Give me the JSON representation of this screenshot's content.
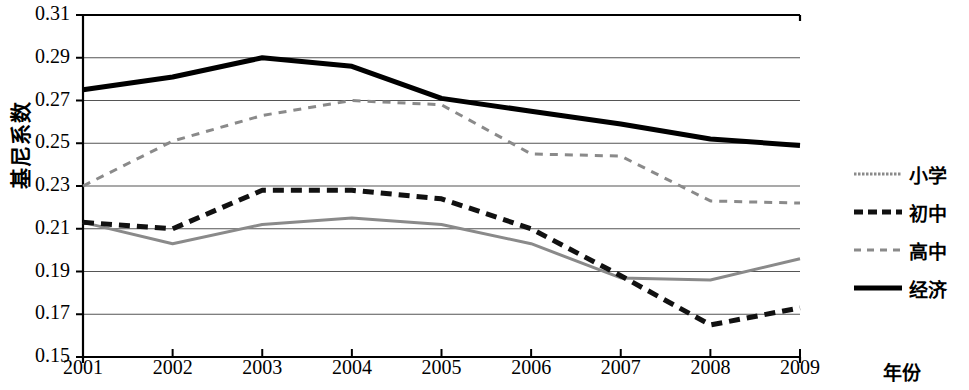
{
  "chart_data": {
    "type": "line",
    "title": "",
    "xlabel": "年份",
    "ylabel": "基尼系数",
    "x": [
      2001,
      2002,
      2003,
      2004,
      2005,
      2006,
      2007,
      2008,
      2009
    ],
    "categories": [
      "2001",
      "2002",
      "2003",
      "2004",
      "2005",
      "2006",
      "2007",
      "2008",
      "2009"
    ],
    "xlim": [
      2001,
      2009
    ],
    "ylim": [
      0.15,
      0.31
    ],
    "yticks": [
      0.15,
      0.17,
      0.19,
      0.21,
      0.23,
      0.25,
      0.27,
      0.29,
      0.31
    ],
    "ytick_labels": [
      "0.15",
      "0.17",
      "0.19",
      "0.21",
      "0.23",
      "0.25",
      "0.27",
      "0.29",
      "0.31"
    ],
    "grid": true,
    "grid_axis": "y",
    "legend_position": "right",
    "series": [
      {
        "name": "小学",
        "values": [
          0.213,
          0.203,
          0.212,
          0.215,
          0.212,
          0.203,
          0.187,
          0.186,
          0.196
        ],
        "color": "#8a8a8a",
        "style": "solid",
        "width": 3
      },
      {
        "name": "初中",
        "values": [
          0.213,
          0.21,
          0.228,
          0.228,
          0.224,
          0.21,
          0.188,
          0.165,
          0.173
        ],
        "color": "#111111",
        "style": "dashed-thick",
        "width": 5
      },
      {
        "name": "高中",
        "values": [
          0.23,
          0.251,
          0.263,
          0.27,
          0.268,
          0.245,
          0.244,
          0.223,
          0.222
        ],
        "color": "#8a8a8a",
        "style": "dashed",
        "width": 3
      },
      {
        "name": "经济",
        "values": [
          0.275,
          0.281,
          0.29,
          0.286,
          0.271,
          0.265,
          0.259,
          0.252,
          0.249
        ],
        "color": "#000000",
        "style": "solid-thick",
        "width": 5
      }
    ]
  },
  "legend": {
    "items": [
      {
        "label": "小学",
        "swatch": "gray-fine-dotted-line"
      },
      {
        "label": "初中",
        "swatch": "black-thick-dashed-line"
      },
      {
        "label": "高中",
        "swatch": "gray-dashed-line"
      },
      {
        "label": "经济",
        "swatch": "black-solid-thick-line"
      }
    ]
  }
}
